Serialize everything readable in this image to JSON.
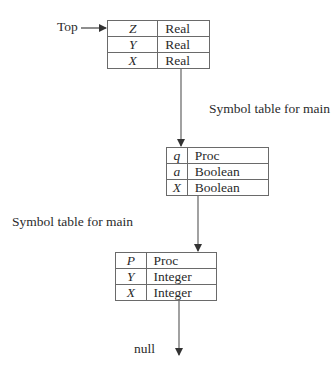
{
  "diagram": {
    "top_label": "Top",
    "null_label": "null",
    "captions": [
      "Symbol table for main",
      "Symbol table for main"
    ],
    "tables": [
      {
        "rows": [
          {
            "name": "Z",
            "type": "Real"
          },
          {
            "name": "Y",
            "type": "Real"
          },
          {
            "name": "X",
            "type": "Real"
          }
        ]
      },
      {
        "rows": [
          {
            "name": "q",
            "type": "Proc"
          },
          {
            "name": "a",
            "type": "Boolean"
          },
          {
            "name": "X",
            "type": "Boolean"
          }
        ]
      },
      {
        "rows": [
          {
            "name": "P",
            "type": "Proc"
          },
          {
            "name": "Y",
            "type": "Integer"
          },
          {
            "name": "X",
            "type": "Integer"
          }
        ]
      }
    ],
    "colors": {
      "line": "#555555",
      "border": "#6a6a6a",
      "text": "#2b2b2b"
    }
  }
}
